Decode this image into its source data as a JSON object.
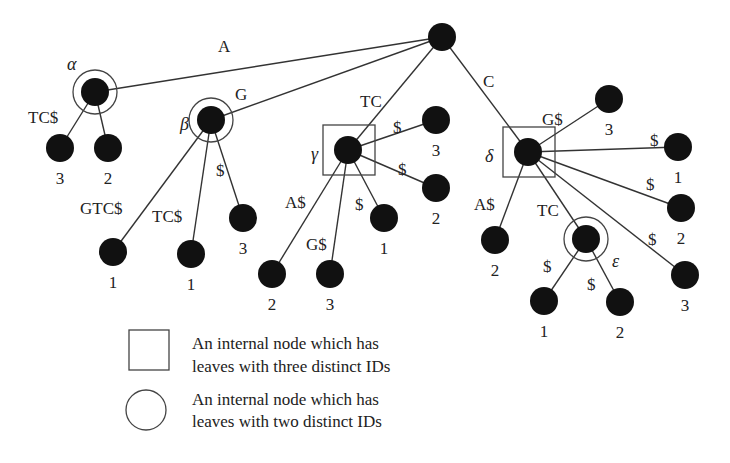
{
  "root": {
    "x": 442,
    "y": 37
  },
  "internal_nodes": [
    {
      "id": "alpha",
      "name": "α",
      "x": 95,
      "y": 92,
      "marker": "circle",
      "greek_pos": [
        67,
        70
      ],
      "edge_label": "A",
      "edge_label_pos": [
        218,
        52
      ]
    },
    {
      "id": "beta",
      "name": "β",
      "x": 211,
      "y": 120,
      "marker": "circle",
      "greek_pos": [
        180,
        130
      ],
      "edge_label": "G",
      "edge_label_pos": [
        235,
        100
      ]
    },
    {
      "id": "gamma",
      "name": "γ",
      "x": 348,
      "y": 150,
      "marker": "square",
      "greek_pos": [
        311,
        160
      ],
      "edge_label": "TC",
      "edge_label_pos": [
        360,
        107
      ]
    },
    {
      "id": "delta",
      "name": "δ",
      "x": 528,
      "y": 152,
      "marker": "square",
      "greek_pos": [
        485,
        162
      ],
      "edge_label": "C",
      "edge_label_pos": [
        483,
        87
      ]
    },
    {
      "id": "epsilon",
      "name": "ε",
      "x": 586,
      "y": 239,
      "marker": "circle",
      "greek_pos": [
        612,
        267
      ],
      "edge_label": "TC",
      "edge_label_pos": [
        537,
        216
      ]
    }
  ],
  "leaves": [
    {
      "parent": "alpha",
      "x": 60,
      "y": 148,
      "id_label": "3",
      "edge_label": "TC$",
      "edge_label_pos": [
        28,
        123
      ]
    },
    {
      "parent": "alpha",
      "x": 108,
      "y": 148,
      "id_label": "2",
      "edge_label": "",
      "edge_label_pos": [
        0,
        0
      ]
    },
    {
      "parent": "beta",
      "x": 113,
      "y": 252,
      "id_label": "1",
      "edge_label": "GTC$",
      "edge_label_pos": [
        80,
        214
      ]
    },
    {
      "parent": "beta",
      "x": 191,
      "y": 254,
      "id_label": "1",
      "edge_label": "TC$",
      "edge_label_pos": [
        152,
        222
      ]
    },
    {
      "parent": "beta",
      "x": 243,
      "y": 218,
      "id_label": "3",
      "edge_label": "$",
      "edge_label_pos": [
        216,
        176
      ]
    },
    {
      "parent": "gamma",
      "x": 436,
      "y": 120,
      "id_label": "3",
      "edge_label": "$",
      "edge_label_pos": [
        393,
        133
      ]
    },
    {
      "parent": "gamma",
      "x": 436,
      "y": 188,
      "id_label": "2",
      "edge_label": "$",
      "edge_label_pos": [
        398,
        175
      ]
    },
    {
      "parent": "gamma",
      "x": 384,
      "y": 218,
      "id_label": "1",
      "edge_label": "$",
      "edge_label_pos": [
        355,
        210
      ]
    },
    {
      "parent": "gamma",
      "x": 272,
      "y": 274,
      "id_label": "2",
      "edge_label": "A$",
      "edge_label_pos": [
        285,
        208
      ]
    },
    {
      "parent": "gamma",
      "x": 330,
      "y": 274,
      "id_label": "3",
      "edge_label": "G$",
      "edge_label_pos": [
        306,
        250
      ]
    },
    {
      "parent": "delta",
      "x": 609,
      "y": 99,
      "id_label": "3",
      "edge_label": "G$",
      "edge_label_pos": [
        542,
        125
      ]
    },
    {
      "parent": "delta",
      "x": 678,
      "y": 147,
      "id_label": "1",
      "edge_label": "$",
      "edge_label_pos": [
        650,
        146
      ]
    },
    {
      "parent": "delta",
      "x": 681,
      "y": 208,
      "id_label": "2",
      "edge_label": "$",
      "edge_label_pos": [
        646,
        190
      ]
    },
    {
      "parent": "delta",
      "x": 495,
      "y": 240,
      "id_label": "2",
      "edge_label": "A$",
      "edge_label_pos": [
        474,
        210
      ]
    },
    {
      "parent": "delta",
      "x": 685,
      "y": 275,
      "id_label": "3",
      "edge_label": "$",
      "edge_label_pos": [
        648,
        245
      ]
    },
    {
      "parent": "epsilon",
      "x": 544,
      "y": 301,
      "id_label": "1",
      "edge_label": "$",
      "edge_label_pos": [
        543,
        272
      ]
    },
    {
      "parent": "epsilon",
      "x": 620,
      "y": 302,
      "id_label": "2",
      "edge_label": "$",
      "edge_label_pos": [
        587,
        290
      ]
    }
  ],
  "legend": {
    "square_label_line1": "An internal node which has",
    "square_label_line2": "leaves with three distinct IDs",
    "circle_label_line1": "An internal node which has",
    "circle_label_line2": "leaves with two distinct IDs"
  }
}
